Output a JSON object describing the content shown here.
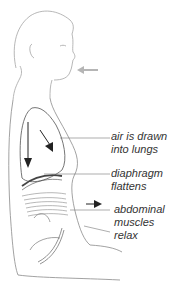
{
  "diagram": {
    "labels": [
      {
        "lines": [
          "air is drawn",
          "into lungs"
        ]
      },
      {
        "lines": [
          "diaphragm",
          "flattens"
        ]
      },
      {
        "lines": [
          "abdominal",
          "muscles",
          "relax"
        ]
      }
    ],
    "icons": {
      "inhale_arrow": "arrow-left-icon",
      "lung_arrows": "arrow-down-icon",
      "abdomen_arrow": "arrow-right-icon"
    },
    "colors": {
      "outline": "#9a9a9a",
      "dark": "#222222",
      "leader": "#777777",
      "inhale_arrow": "#b5b5b5",
      "text": "#333333"
    }
  }
}
